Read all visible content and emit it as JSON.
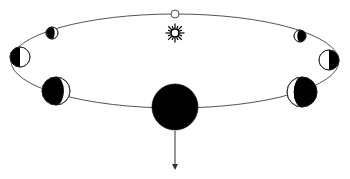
{
  "diagram": {
    "kind": "lunar-phase-orbit",
    "colors": {
      "background": "#ffffff",
      "orbit_line": "#555555",
      "dark_side": "#000000",
      "lit_side": "#ffffff",
      "outline": "#222222"
    },
    "orbit": {
      "cx": 175,
      "cy": 61,
      "rx": 164,
      "ry": 47
    },
    "sun": {
      "name": "sun",
      "cx": 175,
      "cy": 33,
      "r": 4
    },
    "bodies": [
      {
        "name": "full-moon",
        "cx": 175,
        "cy": 14,
        "r": 4,
        "phase": "full",
        "dark_side": "none"
      },
      {
        "name": "gibbous-upper-left",
        "cx": 52,
        "cy": 33,
        "r": 6,
        "phase": "gibbous",
        "dark_side": "left"
      },
      {
        "name": "quarter-left",
        "cx": 20,
        "cy": 57,
        "r": 10,
        "phase": "quarter",
        "dark_side": "left"
      },
      {
        "name": "crescent-lower-left",
        "cx": 56,
        "cy": 91,
        "r": 14,
        "phase": "crescent",
        "dark_side": "left"
      },
      {
        "name": "new-moon",
        "cx": 175,
        "cy": 107,
        "r": 23,
        "phase": "new",
        "dark_side": "all"
      },
      {
        "name": "crescent-lower-right",
        "cx": 302,
        "cy": 92,
        "r": 15,
        "phase": "crescent",
        "dark_side": "right"
      },
      {
        "name": "quarter-right",
        "cx": 329,
        "cy": 60,
        "r": 10,
        "phase": "quarter",
        "dark_side": "right"
      },
      {
        "name": "gibbous-upper-right",
        "cx": 300,
        "cy": 36,
        "r": 6,
        "phase": "gibbous",
        "dark_side": "right"
      }
    ],
    "arrow": {
      "x": 175,
      "y1": 131,
      "y2": 170,
      "direction": "down"
    }
  }
}
